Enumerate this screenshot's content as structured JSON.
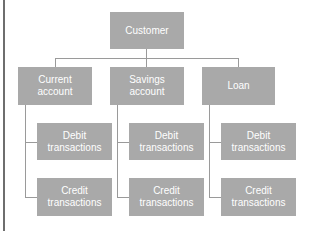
{
  "diagram": {
    "root": {
      "label": "Customer"
    },
    "accounts": [
      {
        "label": "Current\naccount",
        "children": [
          {
            "label": "Debit\ntransactions"
          },
          {
            "label": "Credit\ntransactions"
          }
        ]
      },
      {
        "label": "Savings\naccount",
        "children": [
          {
            "label": "Debit\ntransactions"
          },
          {
            "label": "Credit\ntransactions"
          }
        ]
      },
      {
        "label": "Loan",
        "children": [
          {
            "label": "Debit\ntransactions"
          },
          {
            "label": "Credit\ntransactions"
          }
        ]
      }
    ]
  },
  "colors": {
    "box": "#a9a9a9",
    "line": "#9a9a9a",
    "text": "#ffffff"
  }
}
